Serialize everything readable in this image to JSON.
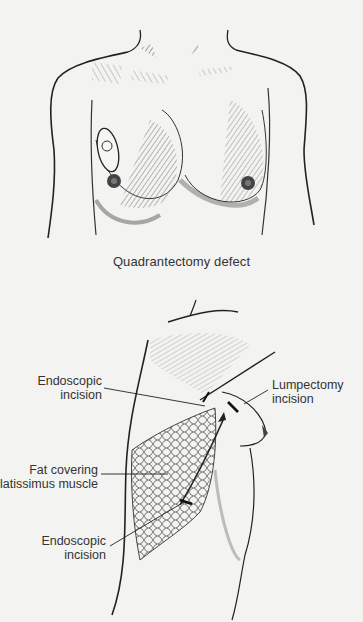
{
  "figures": {
    "top": {
      "caption": "Quadrantectomy defect"
    },
    "bottom": {
      "labels": {
        "endoscopic_incision_upper": {
          "line1": "Endoscopic",
          "line2": "incision"
        },
        "lumpectomy_incision": {
          "line1": "Lumpectomy",
          "line2": "incision"
        },
        "fat_covering": {
          "line1": "Fat covering",
          "line2": "latissimus muscle"
        },
        "endoscopic_incision_lower": {
          "line1": "Endoscopic",
          "line2": "incision"
        }
      }
    }
  },
  "colors": {
    "background": "#f3f3f1",
    "ink": "#2a2a2a",
    "shading": "#5a5a5a"
  }
}
